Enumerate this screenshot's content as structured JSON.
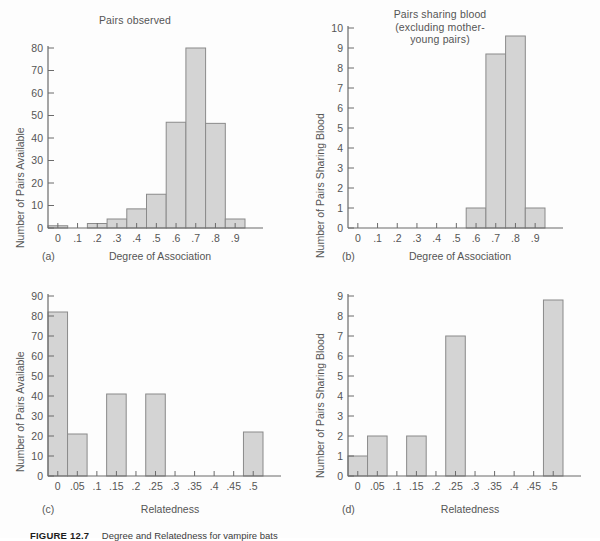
{
  "figure": {
    "caption_label": "FIGURE 12.7",
    "caption_text": "Degree and Relatedness for vampire bats"
  },
  "axis_labels": {
    "left_top": "Number of Pairs Available",
    "left_bottom": "Number of Pairs Available",
    "right_top": "Number of Pairs Sharing Blood",
    "right_bottom": "Number of Pairs Sharing Blood"
  },
  "colors": {
    "bar_fill": "#d4d4d4",
    "bar_stroke": "#8a8a8a",
    "axis": "#6b6b6b",
    "text": "#555555",
    "background": "#fdfdfd"
  },
  "panels": {
    "a": {
      "tag": "(a)",
      "title": "Pairs observed",
      "xlabel": "Degree of Association",
      "ylabel": "Number of Pairs Available"
    },
    "b": {
      "tag": "(b)",
      "title": "Pairs sharing blood\n(excluding mother-\nyoung pairs)",
      "title_line1": "Pairs sharing blood",
      "title_line2": "(excluding mother-",
      "title_line3": "young pairs)",
      "xlabel": "Degree of Association",
      "ylabel": "Number of Pairs Sharing Blood"
    },
    "c": {
      "tag": "(c)",
      "title": "",
      "xlabel": "Relatedness",
      "ylabel": "Number of Pairs Available"
    },
    "d": {
      "tag": "(d)",
      "title": "",
      "xlabel": "Relatedness",
      "ylabel": "Number of Pairs Sharing Blood"
    }
  },
  "chart_data": [
    {
      "id": "a",
      "type": "bar",
      "title": "Pairs observed",
      "xlabel": "Degree of Association",
      "ylabel": "Number of Pairs Available",
      "categories": [
        "0",
        ".1",
        ".2",
        ".3",
        ".4",
        ".5",
        ".6",
        ".7",
        ".8",
        ".9"
      ],
      "values": [
        1,
        0,
        2,
        4,
        8.5,
        15,
        47,
        80,
        46.5,
        4
      ],
      "xticks": [
        "0",
        ".1",
        ".2",
        ".3",
        ".4",
        ".5",
        ".6",
        ".7",
        ".8",
        ".9"
      ],
      "yticks": [
        0,
        10,
        20,
        30,
        40,
        50,
        60,
        70,
        80
      ],
      "xlim": [
        -0.05,
        0.95
      ],
      "ylim": [
        0,
        80
      ],
      "bin_width": 0.1,
      "grid": false,
      "legend": "none"
    },
    {
      "id": "b",
      "type": "bar",
      "title": "Pairs sharing blood (excluding mother-young pairs)",
      "xlabel": "Degree of Association",
      "ylabel": "Number of Pairs Sharing Blood",
      "categories": [
        "0",
        ".1",
        ".2",
        ".3",
        ".4",
        ".5",
        ".6",
        ".7",
        ".8",
        ".9"
      ],
      "values": [
        0,
        0,
        0,
        0,
        0,
        0,
        1,
        8.7,
        9.6,
        1
      ],
      "xticks": [
        "0",
        ".1",
        ".2",
        ".3",
        ".4",
        ".5",
        ".6",
        ".7",
        ".8",
        ".9"
      ],
      "yticks": [
        0,
        1,
        2,
        3,
        4,
        5,
        6,
        7,
        8,
        9,
        10
      ],
      "xlim": [
        -0.05,
        0.95
      ],
      "ylim": [
        0,
        10
      ],
      "bin_width": 0.1,
      "grid": false,
      "legend": "none"
    },
    {
      "id": "c",
      "type": "bar",
      "title": "",
      "xlabel": "Relatedness",
      "ylabel": "Number of Pairs Available",
      "categories": [
        "0",
        ".05",
        ".1",
        ".15",
        ".2",
        ".25",
        ".3",
        ".35",
        ".4",
        ".45",
        ".5"
      ],
      "values": [
        82,
        21,
        0,
        41,
        0,
        41,
        0,
        0,
        0,
        0,
        22
      ],
      "xticks": [
        "0",
        ".05",
        ".1",
        ".15",
        ".2",
        ".25",
        ".3",
        ".35",
        ".4",
        ".45",
        ".5"
      ],
      "yticks": [
        0,
        10,
        20,
        30,
        40,
        50,
        60,
        70,
        80,
        90
      ],
      "xlim": [
        -0.025,
        0.525
      ],
      "ylim": [
        0,
        90
      ],
      "bin_width": 0.05,
      "grid": false,
      "legend": "none"
    },
    {
      "id": "d",
      "type": "bar",
      "title": "",
      "xlabel": "Relatedness",
      "ylabel": "Number of Pairs Sharing Blood",
      "categories": [
        "0",
        ".05",
        ".1",
        ".15",
        ".2",
        ".25",
        ".3",
        ".35",
        ".4",
        ".45",
        ".5"
      ],
      "values": [
        1,
        2,
        0,
        2,
        0,
        7,
        0,
        0,
        0,
        0,
        8.8
      ],
      "xticks": [
        "0",
        ".05",
        ".1",
        ".15",
        ".2",
        ".25",
        ".3",
        ".35",
        ".4",
        ".45",
        ".5"
      ],
      "yticks": [
        0,
        1,
        2,
        3,
        4,
        5,
        6,
        7,
        8,
        9
      ],
      "xlim": [
        -0.025,
        0.525
      ],
      "ylim": [
        0,
        9
      ],
      "bin_width": 0.05,
      "grid": false,
      "legend": "none"
    }
  ]
}
